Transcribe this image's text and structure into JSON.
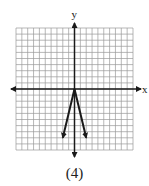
{
  "chart_data": {
    "type": "line",
    "title": "",
    "caption": "(4)",
    "xlabel": "x",
    "ylabel": "y",
    "xlim": [
      -10,
      10
    ],
    "ylim": [
      -10,
      10
    ],
    "grid": true,
    "grid_step": 1,
    "function": "y = -4|x|",
    "series": [
      {
        "name": "absolute-value-graph",
        "points": [
          [
            -2,
            -8
          ],
          [
            0,
            0
          ],
          [
            2,
            -8
          ]
        ],
        "arrow_ends": true
      }
    ],
    "colors": {
      "axis": "#1a1a1a",
      "grid": "#9a9a9a",
      "curve": "#1a1a1a"
    }
  }
}
